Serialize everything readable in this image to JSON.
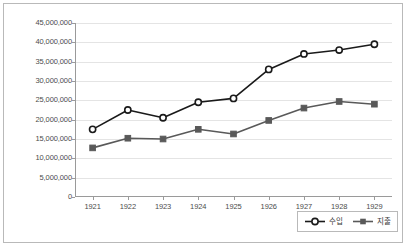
{
  "chart_data": {
    "type": "line",
    "title": "",
    "subtitle": "",
    "xlabel": "",
    "ylabel": "",
    "categories": [
      "1921",
      "1922",
      "1923",
      "1924",
      "1925",
      "1926",
      "1927",
      "1928",
      "1929"
    ],
    "ylim": [
      0,
      45000000
    ],
    "ytick_labels": [
      "45,000,000",
      "40,000,000",
      "35,000,000",
      "30,000,000",
      "25,000,000",
      "20,000,000",
      "15,000,000",
      "10,000,000",
      "5,000,000",
      "0"
    ],
    "ytick_values": [
      45000000,
      40000000,
      35000000,
      30000000,
      25000000,
      20000000,
      15000000,
      10000000,
      5000000,
      0
    ],
    "grid": true,
    "grid_axis": "y",
    "legend_position": "bottom-right",
    "series": [
      {
        "name": "수입",
        "marker": "open-circle",
        "color": "#1a1a1a",
        "values": [
          17500000,
          22500000,
          20500000,
          24500000,
          25500000,
          33000000,
          37000000,
          38000000,
          39500000
        ]
      },
      {
        "name": "지출",
        "marker": "filled-square",
        "color": "#595959",
        "values": [
          12700000,
          15200000,
          15000000,
          17500000,
          16300000,
          19800000,
          23000000,
          24700000,
          24000000
        ]
      }
    ]
  },
  "legend": {
    "entries": [
      {
        "label": "수입"
      },
      {
        "label": "지출"
      }
    ]
  }
}
